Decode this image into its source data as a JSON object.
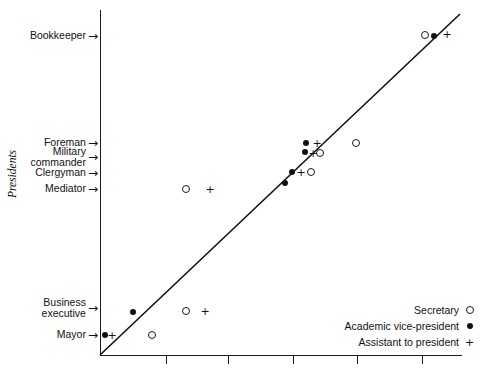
{
  "chart_data": {
    "type": "scatter",
    "title": "",
    "xlabel": "",
    "ylabel": "Presidents",
    "xlim": [
      0,
      6
    ],
    "ylim": [
      0,
      6
    ],
    "grid": false,
    "legend_position": "bottom-right",
    "reference_line": {
      "type": "identity",
      "label": "y = x",
      "from": [
        0,
        0
      ],
      "to": [
        5.6,
        5.6
      ]
    },
    "y_categories": [
      {
        "label": "Bookkeeper",
        "y": 36
      },
      {
        "label": "Foreman",
        "y": 143
      },
      {
        "label": "Military\ncommander",
        "y": 157
      },
      {
        "label": "Clergyman",
        "y": 173
      },
      {
        "label": "Mediator",
        "y": 189
      },
      {
        "label": "Business\nexecutive",
        "y": 308
      },
      {
        "label": "Mayor",
        "y": 335
      }
    ],
    "x_ticks": [
      166,
      228,
      293,
      357,
      422
    ],
    "series": [
      {
        "name": "Secretary",
        "symbol": "open-circle",
        "points": [
          {
            "x": 152,
            "y": 335
          },
          {
            "x": 186,
            "y": 311
          },
          {
            "x": 186,
            "y": 189
          },
          {
            "x": 311,
            "y": 172
          },
          {
            "x": 320,
            "y": 153
          },
          {
            "x": 356,
            "y": 143
          },
          {
            "x": 425,
            "y": 35
          }
        ]
      },
      {
        "name": "Academic vice-president",
        "symbol": "filled-circle",
        "points": [
          {
            "x": 105,
            "y": 335
          },
          {
            "x": 133,
            "y": 312
          },
          {
            "x": 285,
            "y": 183
          },
          {
            "x": 292,
            "y": 172
          },
          {
            "x": 305,
            "y": 152
          },
          {
            "x": 306,
            "y": 143
          },
          {
            "x": 434,
            "y": 36
          }
        ]
      },
      {
        "name": "Assistant to president",
        "symbol": "plus",
        "points": [
          {
            "x": 112,
            "y": 335
          },
          {
            "x": 205,
            "y": 311
          },
          {
            "x": 210,
            "y": 189
          },
          {
            "x": 301,
            "y": 172
          },
          {
            "x": 313,
            "y": 153
          },
          {
            "x": 317,
            "y": 143
          },
          {
            "x": 447,
            "y": 34
          }
        ]
      }
    ]
  },
  "axis": {
    "y_title": "Presidents",
    "arrow_glyph": "→"
  },
  "legend": {
    "entries": [
      {
        "label": "Secretary",
        "symbol": "open-circle"
      },
      {
        "label": "Academic vice-president",
        "symbol": "filled-circle"
      },
      {
        "label": "Assistant to president",
        "symbol": "plus"
      }
    ]
  },
  "top_caption": {
    "text": ""
  }
}
